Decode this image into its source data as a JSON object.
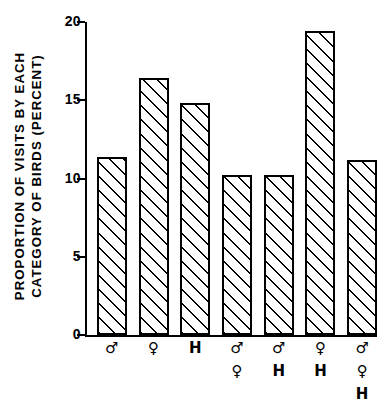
{
  "chart_data": {
    "type": "bar",
    "title": "",
    "subtitle": "",
    "xlabel": "",
    "ylabel": "PROPORTION OF VISITS BY EACH CATEGORY OF BIRDS (PERCENT)",
    "ylabel_lines": [
      "PROPORTION OF VISITS BY EACH",
      "CATEGORY OF BIRDS (PERCENT)"
    ],
    "categories": [
      "♂",
      "♀",
      "H",
      "♂♀",
      "♂H",
      "♀H",
      "♂♀H"
    ],
    "category_symbol_stacks": [
      [
        "♂"
      ],
      [
        "♀"
      ],
      [
        "H"
      ],
      [
        "♂",
        "♀"
      ],
      [
        "♂",
        "H"
      ],
      [
        "♀",
        "H"
      ],
      [
        "♂",
        "♀",
        "H"
      ]
    ],
    "values": [
      11.4,
      16.4,
      14.8,
      10.2,
      10.2,
      19.4,
      11.2
    ],
    "ylim": [
      0,
      20
    ],
    "yticks": [
      0,
      5,
      10,
      15,
      20
    ],
    "ytick_labels": [
      "0",
      "5",
      "10",
      "15",
      "20"
    ],
    "grid": false,
    "legend": false,
    "legend_position": "none",
    "bar_fill": "diagonal-hatch",
    "bar_edge_color": "#000000",
    "bar_face_color": "#ffffff",
    "background_color": "#ffffff",
    "annotations": []
  }
}
